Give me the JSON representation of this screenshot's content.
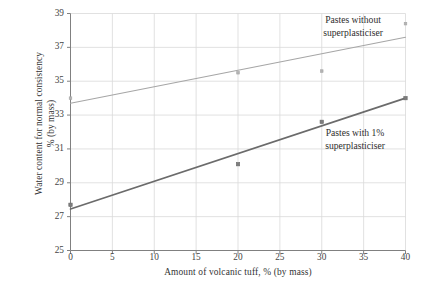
{
  "chart_data": {
    "type": "scatter",
    "title": "",
    "xlabel": "Amount of  volcanic tuff, % (by mass)",
    "ylabel": "Water content for normal consistency\n% (by mass)",
    "xlim": [
      0,
      40
    ],
    "ylim": [
      25,
      39
    ],
    "xticks": [
      0,
      5,
      10,
      15,
      20,
      25,
      30,
      35,
      40
    ],
    "yticks": [
      25,
      27,
      29,
      31,
      33,
      35,
      37,
      39
    ],
    "grid": true,
    "legend_position": "inline-annotations",
    "series": [
      {
        "name": "Pastes without superplasticiser",
        "color": "#a6a6a6",
        "x": [
          0,
          20,
          30,
          40
        ],
        "values": [
          34.0,
          35.5,
          35.6,
          38.4
        ],
        "trendline": {
          "x": [
            0,
            40
          ],
          "y": [
            33.7,
            37.6
          ]
        }
      },
      {
        "name": "Pastes with 1% superplasticiser",
        "color": "#6b6b6b",
        "x": [
          0,
          20,
          30,
          40
        ],
        "values": [
          27.7,
          30.1,
          32.6,
          34.0
        ],
        "trendline": {
          "x": [
            0,
            40
          ],
          "y": [
            27.45,
            34.0
          ]
        }
      }
    ],
    "annotations": [
      {
        "id": "without",
        "text": "Pastes without\nsuperplasticiser"
      },
      {
        "id": "with",
        "text": "Pastes with 1%\nsuperplasticiser"
      }
    ]
  },
  "colors": {
    "grid": "#d9d9d9",
    "axis": "#808080",
    "series_upper": "#a6a6a6",
    "series_lower": "#6b6b6b",
    "text": "#333333"
  }
}
